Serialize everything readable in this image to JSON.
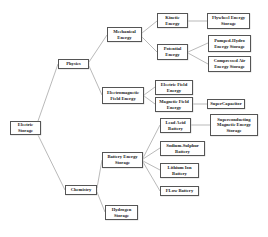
{
  "diagram": {
    "type": "tree",
    "root": "Electric Storage",
    "nodes": {
      "electric_storage": "Electric Storage",
      "physics": "Physics",
      "chemistry": "Chemistry",
      "mechanical_energy": "Mechanical Energy",
      "electromagnetic_field_energy": "Electromagnetic Field Energy",
      "kinetic_energy": "Kinetic Energy",
      "potential_energy": "Potential Energy",
      "flywheel": "Flywheel Energy Storage",
      "pumped_hydro": "Pumped-Hydro Energy Storage",
      "compressed_air": "Compressed Air Energy Storage",
      "electric_field_energy": "Electric Field Energy",
      "magnetic_field_energy": "Magnetic Field Energy",
      "supercapacitor": "SuperCapacitor",
      "battery_energy_storage": "Battery Energy Storage",
      "hydrogen_storage": "Hydrogen Storage",
      "lead_acid": "Lead Acid Battery",
      "smes": "Superconducting Magnetic Energy Storage",
      "sodium_sulphur": "Sodium-Sulphur Battery",
      "lithium_ion": "Lithium Ion Battery",
      "flow_battery": "FLow Battery"
    },
    "edges": [
      [
        "Electric Storage",
        "Physics"
      ],
      [
        "Electric Storage",
        "Chemistry"
      ],
      [
        "Physics",
        "Mechanical Energy"
      ],
      [
        "Physics",
        "Electromagnetic Field Energy"
      ],
      [
        "Mechanical Energy",
        "Kinetic Energy"
      ],
      [
        "Mechanical Energy",
        "Potential Energy"
      ],
      [
        "Kinetic Energy",
        "Flywheel Energy Storage"
      ],
      [
        "Potential Energy",
        "Pumped-Hydro Energy Storage"
      ],
      [
        "Potential Energy",
        "Compressed Air Energy Storage"
      ],
      [
        "Electromagnetic Field Energy",
        "Electric Field Energy"
      ],
      [
        "Electromagnetic Field Energy",
        "Magnetic Field Energy"
      ],
      [
        "Magnetic Field Energy",
        "SuperCapacitor"
      ],
      [
        "Chemistry",
        "Battery Energy Storage"
      ],
      [
        "Chemistry",
        "Hydrogen Storage"
      ],
      [
        "Battery Energy Storage",
        "Lead Acid Battery"
      ],
      [
        "Battery Energy Storage",
        "Sodium-Sulphur Battery"
      ],
      [
        "Battery Energy Storage",
        "Lithium Ion Battery"
      ],
      [
        "Battery Energy Storage",
        "FLow Battery"
      ],
      [
        "Lead Acid Battery",
        "Superconducting Magnetic Energy Storage"
      ]
    ]
  },
  "colors": {
    "box_border": "#555555",
    "link": "#8a8a8a",
    "text": "#222222",
    "background": "#ffffff"
  }
}
